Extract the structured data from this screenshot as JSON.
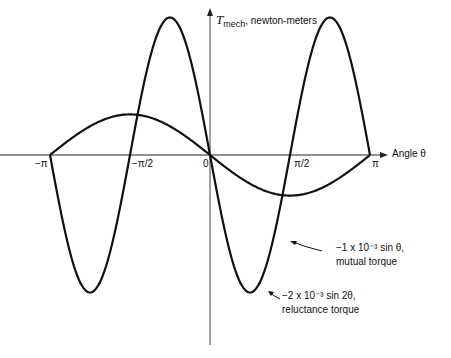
{
  "chart_data": {
    "type": "line",
    "title": "",
    "ylabel_symbol": "T",
    "ylabel_sub": "mech",
    "ylabel_units": ", newton-meters",
    "xlabel": "Angle θ",
    "x_ticks": [
      "−π",
      "−π/2",
      "0",
      "π/2",
      "π"
    ],
    "xlim": [
      -3.1416,
      3.1416
    ],
    "series": [
      {
        "name": "mutual torque",
        "formula": "−1 x 10⁻³ sin θ",
        "amplitude": 0.001,
        "x": [
          -3.1416,
          -1.5708,
          0,
          1.5708,
          3.1416
        ],
        "values": [
          0,
          0.001,
          0,
          -0.001,
          0
        ]
      },
      {
        "name": "reluctance torque",
        "formula": "−2 x 10⁻³ sin 2θ",
        "amplitude": 0.002,
        "x": [
          -3.1416,
          -2.3562,
          -1.5708,
          -0.7854,
          0,
          0.7854,
          1.5708,
          2.3562,
          3.1416
        ],
        "values": [
          0,
          -0.002,
          0,
          0.002,
          0,
          -0.002,
          0,
          0.002,
          0
        ]
      }
    ]
  },
  "labels": {
    "y_symbol": "T",
    "y_sub": "mech",
    "y_units": ", newton-meters",
    "x_axis": "Angle θ",
    "tick_neg_pi": "−π",
    "tick_neg_half_pi": "−π/2",
    "tick_zero": "0",
    "tick_half_pi": "π/2",
    "tick_pi": "π",
    "mutual_formula": "−1 x 10⁻³ sin θ,",
    "mutual_name": "mutual torque",
    "reluct_formula": "−2 x 10⁻³ sin 2θ,",
    "reluct_name": "reluctance torque"
  }
}
